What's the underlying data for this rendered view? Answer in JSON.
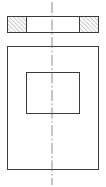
{
  "drawing": {
    "type": "orthographic-engineering-drawing",
    "title": "Plate with rectangular opening",
    "canvas": {
      "width": 106,
      "height": 187,
      "background": "#ffffff"
    },
    "colors": {
      "outline": "#3a3a3a",
      "hatch": "#4a4a4a",
      "centerline": "#6e6e6e",
      "background": "#ffffff"
    },
    "views": [
      {
        "name": "section-view",
        "label": "Top sectional view",
        "shape": "rectangle",
        "x": 7,
        "y": 16,
        "width": 91,
        "height": 16,
        "hatched_segments": [
          {
            "name": "left-hatch-block",
            "x": 7,
            "y": 16,
            "width": 19,
            "height": 16,
            "angle_deg": 45,
            "spacing": 3
          },
          {
            "name": "right-hatch-block",
            "x": 79,
            "y": 16,
            "width": 19,
            "height": 16,
            "angle_deg": 45,
            "spacing": 3
          }
        ],
        "open_segment": {
          "name": "opening-gap",
          "x": 26,
          "y": 16,
          "width": 53,
          "height": 16
        }
      },
      {
        "name": "plan-view",
        "label": "Bottom plan view",
        "outer_rect": {
          "name": "outer-plate-outline",
          "x": 7,
          "y": 46,
          "width": 91,
          "height": 123
        },
        "inner_rect": {
          "name": "inner-opening-outline",
          "x": 26,
          "y": 72,
          "width": 53,
          "height": 41
        }
      }
    ],
    "centerline": {
      "name": "vertical-centerline",
      "orientation": "vertical",
      "x": 52,
      "y_start": 2,
      "y_end": 185,
      "style": "dash-dot"
    }
  }
}
